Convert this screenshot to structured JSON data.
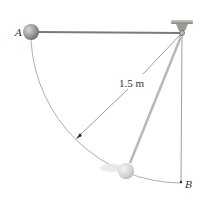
{
  "diagram": {
    "labels": {
      "point_a": "A",
      "point_b": "B",
      "radius": "1.5 m"
    },
    "colors": {
      "rod": "#7a7a7a",
      "ball_a": "#9a9a9a",
      "ball_b": "#d8d8d8",
      "arc": "#8a8a8a",
      "support": "#b0a8a0"
    }
  }
}
